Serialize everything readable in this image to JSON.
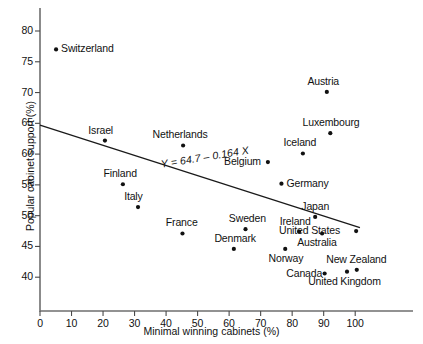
{
  "chart_data": {
    "type": "scatter",
    "title": "",
    "xlabel": "Minimal winning cabinets (%)",
    "ylabel": "Popular cabinet support (%)",
    "xlim": [
      0,
      105
    ],
    "ylim": [
      37,
      82.5
    ],
    "xticks": [
      0,
      10,
      20,
      30,
      40,
      50,
      60,
      70,
      80,
      90,
      100
    ],
    "yticks": [
      40,
      45,
      50,
      55,
      60,
      65,
      70,
      75,
      80
    ],
    "grid": false,
    "legend": "none",
    "annotation": "Y = 64.7 – 0.164 X",
    "fit": {
      "intercept": 64.7,
      "slope": -0.164,
      "x_start": 0,
      "x_end": 101.5
    },
    "points": [
      {
        "label": "Switzerland",
        "x": 5.1,
        "y": 77.0,
        "label_side": "right"
      },
      {
        "label": "Israel",
        "x": 20.6,
        "y": 62.2,
        "label_side": "above"
      },
      {
        "label": "Finland",
        "x": 26.3,
        "y": 55.1,
        "label_side": "above"
      },
      {
        "label": "Italy",
        "x": 31.1,
        "y": 51.4,
        "label_side": "above"
      },
      {
        "label": "Netherlands",
        "x": 45.4,
        "y": 61.4,
        "label_side": "above"
      },
      {
        "label": "France",
        "x": 45.2,
        "y": 47.1,
        "label_side": "above"
      },
      {
        "label": "Denmark",
        "x": 61.5,
        "y": 44.6,
        "label_side": "above"
      },
      {
        "label": "Sweden",
        "x": 65.2,
        "y": 47.8,
        "label_side": "above"
      },
      {
        "label": "Belgium",
        "x": 72.3,
        "y": 58.7,
        "label_side": "left"
      },
      {
        "label": "Germany",
        "x": 76.6,
        "y": 55.2,
        "label_side": "right"
      },
      {
        "label": "Norway",
        "x": 77.8,
        "y": 44.6,
        "label_side": "below"
      },
      {
        "label": "Ireland",
        "x": 82.2,
        "y": 47.4,
        "label_side": "above"
      },
      {
        "label": "Iceland",
        "x": 83.4,
        "y": 60.1,
        "label_side": "above"
      },
      {
        "label": "Japan",
        "x": 87.3,
        "y": 49.8,
        "label_side": "above"
      },
      {
        "label": "Australia",
        "x": 89.5,
        "y": 47.1,
        "label_side": "below"
      },
      {
        "label": "Canada",
        "x": 90.3,
        "y": 40.6,
        "label_side": "left"
      },
      {
        "label": "Austria",
        "x": 91.0,
        "y": 70.1,
        "label_side": "above"
      },
      {
        "label": "Luxembourg",
        "x": 92.1,
        "y": 63.4,
        "label_side": "above"
      },
      {
        "label": "United Kingdom",
        "x": 97.4,
        "y": 40.9,
        "label_side": "below"
      },
      {
        "label": "New Zealand",
        "x": 100.5,
        "y": 41.2,
        "label_side": "above"
      },
      {
        "label": "United States",
        "x": 100.3,
        "y": 47.5,
        "label_side": "left"
      }
    ]
  }
}
